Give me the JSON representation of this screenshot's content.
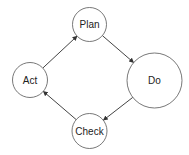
{
  "diagram": {
    "type": "cycle",
    "nodes": [
      {
        "id": "plan",
        "label": "Plan",
        "cx": 89.5,
        "cy": 24.5,
        "r": 17
      },
      {
        "id": "do",
        "label": "Do",
        "cx": 154.5,
        "cy": 80.5,
        "r": 27.5
      },
      {
        "id": "check",
        "label": "Check",
        "cx": 89.5,
        "cy": 131,
        "r": 17.5
      },
      {
        "id": "act",
        "label": "Act",
        "cx": 30,
        "cy": 80,
        "r": 17.5
      }
    ],
    "edges": [
      {
        "from": "act",
        "to": "plan"
      },
      {
        "from": "plan",
        "to": "do"
      },
      {
        "from": "do",
        "to": "check"
      },
      {
        "from": "check",
        "to": "act"
      }
    ],
    "colors": {
      "stroke": "#555555",
      "fill": "#ffffff",
      "text": "#222222"
    }
  }
}
